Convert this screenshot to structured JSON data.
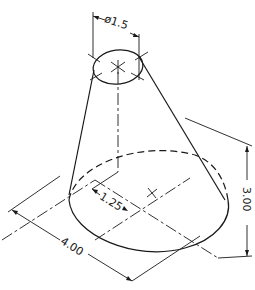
{
  "figure": {
    "type": "isometric technical drawing",
    "line_color": "#1a1a1a",
    "background": "#ffffff"
  },
  "dimensions": {
    "top_diameter": "ø1.5",
    "offset": "1.25",
    "base_width": "4.00",
    "height": "3.00"
  }
}
